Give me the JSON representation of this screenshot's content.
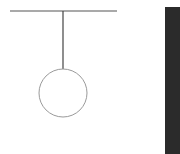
{
  "diagram": {
    "type": "pendulum",
    "elements": [
      {
        "name": "support-beam",
        "shape": "line"
      },
      {
        "name": "pendulum-string",
        "shape": "line"
      },
      {
        "name": "pendulum-bob",
        "shape": "circle"
      },
      {
        "name": "dark-panel",
        "shape": "rectangle"
      }
    ],
    "colors": {
      "background": "#ffffff",
      "beam": "#555555",
      "string": "#444444",
      "bob_stroke": "#9a9a9a",
      "bob_fill": "#ffffff",
      "panel": "#2b2b2b"
    }
  }
}
